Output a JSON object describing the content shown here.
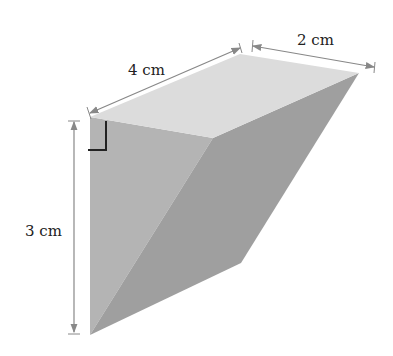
{
  "figure": {
    "type": "3D solid (triangular wedge / prism)",
    "labels": {
      "length": "4 cm",
      "width": "2 cm",
      "height": "3 cm"
    },
    "right_angle_marker": true,
    "colors": {
      "top_face": "#dcdcdc",
      "front_face": "#b4b4b4",
      "right_face": "#9d9d9d",
      "dimension_lines": "#888888",
      "text": "#222222"
    }
  }
}
